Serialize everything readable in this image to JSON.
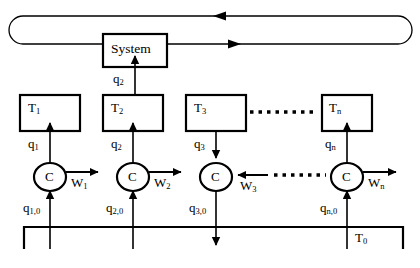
{
  "diagram": {
    "stroke_color": "#000000",
    "background_color": "#ffffff",
    "system_block": {
      "label": "System",
      "x": 103,
      "y": 34,
      "w": 64,
      "h": 33
    },
    "loop": {
      "name": "system-feedback-loop",
      "x": 9,
      "y": 16,
      "w": 403,
      "h": 28,
      "top_arrow_label": "",
      "top_arrow_direction": "left",
      "bottom_arrow_direction": "right"
    },
    "t_blocks": [
      {
        "id": "t1",
        "base": "T",
        "sub": "1",
        "x": 20,
        "y": 95,
        "w": 60,
        "h": 36
      },
      {
        "id": "t2",
        "base": "T",
        "sub": "2",
        "x": 103,
        "y": 95,
        "w": 60,
        "h": 36
      },
      {
        "id": "t3",
        "base": "T",
        "sub": "3",
        "x": 186,
        "y": 95,
        "w": 60,
        "h": 36
      },
      {
        "id": "tn",
        "base": "T",
        "sub": "n",
        "x": 322,
        "y": 95,
        "w": 50,
        "h": 36
      }
    ],
    "controllers": [
      {
        "id": "c1",
        "label": "C",
        "cx": 50,
        "cy": 177,
        "rx": 16,
        "ry": 14
      },
      {
        "id": "c2",
        "label": "C",
        "cx": 133,
        "cy": 177,
        "rx": 16,
        "ry": 14
      },
      {
        "id": "c3",
        "label": "C",
        "cx": 216,
        "cy": 177,
        "rx": 16,
        "ry": 14
      },
      {
        "id": "cn",
        "label": "C",
        "cx": 347,
        "cy": 177,
        "rx": 16,
        "ry": 14
      }
    ],
    "q_signals": [
      {
        "id": "q1",
        "base": "q",
        "sub": "1",
        "x": 28,
        "y": 141,
        "direction": "up"
      },
      {
        "id": "q2_sys",
        "base": "q",
        "sub": "2",
        "x": 112,
        "y": 77,
        "direction": "up"
      },
      {
        "id": "q2",
        "base": "q",
        "sub": "2",
        "x": 111,
        "y": 141,
        "direction": "up"
      },
      {
        "id": "q3",
        "base": "q",
        "sub": "3",
        "x": 194,
        "y": 141,
        "direction": "down"
      },
      {
        "id": "qn",
        "base": "q",
        "sub": "n",
        "x": 325,
        "y": 141,
        "direction": "up"
      }
    ],
    "q0_signals": [
      {
        "id": "q10",
        "base": "q",
        "sub": "1,0",
        "x": 24,
        "y": 205,
        "direction": "up"
      },
      {
        "id": "q20",
        "base": "q",
        "sub": "2,0",
        "x": 107,
        "y": 205,
        "direction": "up"
      },
      {
        "id": "q30",
        "base": "q",
        "sub": "3,0",
        "x": 190,
        "y": 205,
        "direction": "down"
      },
      {
        "id": "qn0",
        "base": "q",
        "sub": "n,0",
        "x": 321,
        "y": 205,
        "direction": "up"
      }
    ],
    "w_signals": [
      {
        "id": "w1",
        "base": "W",
        "sub": "1",
        "x": 72,
        "y": 182,
        "direction": "right"
      },
      {
        "id": "w2",
        "base": "W",
        "sub": "2",
        "x": 155,
        "y": 182,
        "direction": "right"
      },
      {
        "id": "w3",
        "base": "W",
        "sub": "3",
        "x": 241,
        "y": 182,
        "direction": "left"
      },
      {
        "id": "wn",
        "base": "W",
        "sub": "n",
        "x": 369,
        "y": 182,
        "direction": "right"
      }
    ],
    "t0_bus": {
      "label_base": "T",
      "label_sub": "0",
      "label_x": 355,
      "label_y": 232,
      "line_y": 227,
      "left_x": 24,
      "right_x": 403,
      "tick_drop": 22
    },
    "dotted_connectors": [
      {
        "id": "dots-t-row",
        "x1": 248,
        "y": 112,
        "x2": 320
      },
      {
        "id": "dots-c-row",
        "x1": 253,
        "y": 177,
        "x2": 325
      }
    ]
  }
}
